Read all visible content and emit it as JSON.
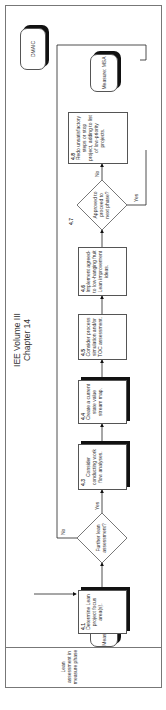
{
  "title": {
    "line1": "IEE Volume III",
    "line2": "Chapter 14"
  },
  "lane": {
    "label": "Lean assessment in measure phase"
  },
  "terminals": {
    "start": "Measure: Baseline",
    "end": "Measure: MSA",
    "dmaic": "DMAIC"
  },
  "steps": [
    {
      "num": "4.1",
      "text": "Determine Lean project focus area(s)."
    },
    {
      "num": "4.3",
      "text": "Consider conducting work flow analyses."
    },
    {
      "num": "4.4",
      "text": "Create a current state value stream map."
    },
    {
      "num": "4.5",
      "text": "Consider process simulation and/or TOC assessment."
    },
    {
      "num": "4.6",
      "text": "Implement agreed-to low-hanging fruit Lean improvement ideas."
    },
    {
      "num": "4.8",
      "text": "Redo unsatisfactory steps or stop project, adding to list of low-priority projects."
    }
  ],
  "decisions": [
    {
      "num": "",
      "text": "Further lean assessment?",
      "yes": "Yes",
      "no": "No"
    },
    {
      "num": "4.7",
      "text": "Approved to proceed to next phase?",
      "yes": "Yes",
      "no": "No"
    }
  ]
}
